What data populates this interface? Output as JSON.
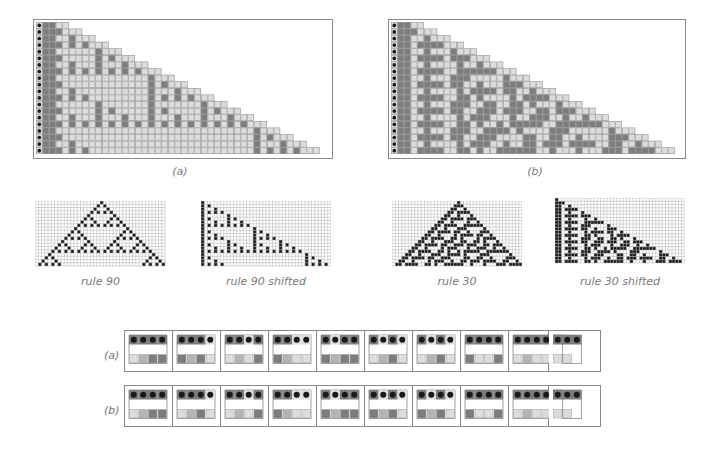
{
  "figure": {
    "top_panels": [
      {
        "id": "a",
        "label": "(a)",
        "rule": 90,
        "rows": 20,
        "first_width": 5,
        "growth": 2,
        "cell_size": 6.6,
        "dot_column": true
      },
      {
        "id": "b",
        "label": "(b)",
        "rule": 30,
        "rows": 20,
        "first_width": 5,
        "growth": 2,
        "cell_size": 6.6,
        "dot_column": true
      }
    ],
    "small_panels": [
      {
        "id": "rule90",
        "caption": "rule 90",
        "rule": 90,
        "mode": "centered"
      },
      {
        "id": "rule90s",
        "caption": "rule 90 shifted",
        "rule": 90,
        "mode": "shifted"
      },
      {
        "id": "rule30",
        "caption": "rule 30",
        "rule": 30,
        "mode": "centered"
      },
      {
        "id": "rule30s",
        "caption": "rule 30 shifted",
        "rule": 30,
        "mode": "shifted"
      }
    ],
    "rule_tables": [
      {
        "label": "(a)",
        "boxes": [
          {
            "top": "dddd",
            "bottom": "lmdd"
          },
          {
            "top": "dddl",
            "bottom": "dmdl"
          },
          {
            "top": "ddld",
            "bottom": "lmld"
          },
          {
            "top": "ddll",
            "bottom": "dmll"
          },
          {
            "top": "dldd",
            "bottom": "dmdd"
          },
          {
            "top": "dldl",
            "bottom": "lmdl"
          },
          {
            "top": "dldl",
            "bottom": "lmdl"
          },
          {
            "top": "dddd",
            "bottom": "dlld"
          },
          {
            "top": "dddd",
            "bottom": "lmll"
          },
          {
            "top": "ddd",
            "bottom": "ll"
          },
          {
            "top": "d",
            "bottom": "mlll"
          }
        ]
      },
      {
        "label": "(b)",
        "boxes": [
          {
            "top": "dddd",
            "bottom": "lmdd"
          },
          {
            "top": "dddl",
            "bottom": "lmdl"
          },
          {
            "top": "ddld",
            "bottom": "lmld"
          },
          {
            "top": "ddll",
            "bottom": "dmll"
          },
          {
            "top": "dldd",
            "bottom": "dmdd"
          },
          {
            "top": "dldl",
            "bottom": "dmdl"
          },
          {
            "top": "dldl",
            "bottom": "dmdl"
          },
          {
            "top": "dddd",
            "bottom": "dlld"
          },
          {
            "top": "dddd",
            "bottom": "lmll"
          },
          {
            "top": "ddd",
            "bottom": "ll"
          },
          {
            "top": "d",
            "bottom": "mlll"
          }
        ]
      }
    ],
    "colors": {
      "dark_cell": "#7d7d7d",
      "light_cell": "#dcdcdc",
      "mid_cell": "#b4b4b4",
      "grid_line": "#9a9a9a",
      "black_cell": "#1a1a1a",
      "dot": "#1a1a1a",
      "caption": "#7a7a7a"
    }
  }
}
